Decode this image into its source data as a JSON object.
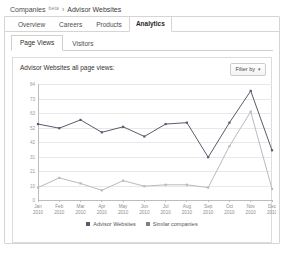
{
  "breadcrumb": {
    "root_label": "Companies",
    "beta_label": "beta",
    "separator": "›",
    "current_label": "Advisor Websites"
  },
  "tabs_primary": [
    {
      "label": "Overview",
      "active": false
    },
    {
      "label": "Careers",
      "active": false
    },
    {
      "label": "Products",
      "active": false
    },
    {
      "label": "Analytics",
      "active": true
    }
  ],
  "tabs_sub": [
    {
      "label": "Page Views",
      "active": true
    },
    {
      "label": "Visitors",
      "active": false
    }
  ],
  "chart_card": {
    "title": "Advisor Websites all page views:",
    "filter_label": "Filter by",
    "filter_caret": "▾"
  },
  "colors": {
    "series_primary": "#5a5a6e",
    "series_secondary": "#b9b9c4",
    "grid": "#e8e8e8",
    "axis": "#bcbcbc",
    "panel_border": "#d5d5d5",
    "text": "#333333"
  },
  "chart_data": {
    "type": "line",
    "title": "Advisor Websites all page views:",
    "xlabel": "",
    "ylabel": "",
    "grid": true,
    "legend_position": "bottom",
    "ylim": [
      0,
      84
    ],
    "yticks": [
      0,
      10,
      21,
      31,
      42,
      52,
      63,
      73,
      84
    ],
    "ytick_labels": [
      "0",
      "10",
      "21",
      "31",
      "42",
      "52",
      "63",
      "73",
      "84"
    ],
    "categories": [
      "Jan 2010",
      "Feb 2010",
      "Mar 2010",
      "Apr 2010",
      "May 2010",
      "Jun 2010",
      "Jul 2010",
      "Aug 2010",
      "Sep 2010",
      "Oct 2010",
      "Nov 2010",
      "Dec 2010"
    ],
    "category_lines": [
      [
        "Jan",
        "2010"
      ],
      [
        "Feb",
        "2010"
      ],
      [
        "Mar",
        "2010"
      ],
      [
        "Apr",
        "2010"
      ],
      [
        "May",
        "2010"
      ],
      [
        "Jun",
        "2010"
      ],
      [
        "Jul",
        "2010"
      ],
      [
        "Aug",
        "2010"
      ],
      [
        "Sep",
        "2010"
      ],
      [
        "Oct",
        "2010"
      ],
      [
        "Nov",
        "2010"
      ],
      [
        "Dec",
        "2010"
      ]
    ],
    "series": [
      {
        "name": "Advisor Websites",
        "color": "#5a5a6e",
        "values": [
          55,
          52,
          58,
          49,
          53,
          46,
          55,
          56,
          31,
          56,
          79,
          36
        ]
      },
      {
        "name": "Similar companies",
        "color": "#b9b9c4",
        "values": [
          9,
          16,
          12,
          7,
          14,
          10,
          11,
          11,
          9,
          39,
          64,
          8
        ]
      }
    ]
  },
  "legend": [
    {
      "label": "Advisor Websites",
      "color": "#5a5a6e"
    },
    {
      "label": "Similar companies",
      "color": "#7e7e8c"
    }
  ]
}
